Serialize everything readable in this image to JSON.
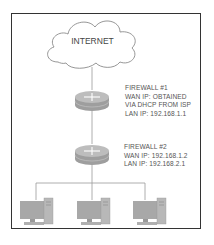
{
  "diagram": {
    "type": "network-topology",
    "cloud": {
      "label": "INTERNET"
    },
    "firewalls": [
      {
        "title": "FIREWALL #1",
        "lines": [
          "WAN IP: OBTAINED",
          "VIA DHCP FROM ISP",
          "LAN IP: 192.168.1.1"
        ]
      },
      {
        "title": "FIREWALL #2",
        "lines": [
          "WAN IP: 192.168.1.2",
          "LAN IP: 192.168.2.1"
        ]
      }
    ],
    "computers": [
      {
        "icon": "desktop-computer-icon"
      },
      {
        "icon": "desktop-computer-icon"
      },
      {
        "icon": "desktop-computer-icon"
      }
    ],
    "colors": {
      "frame": "#333333",
      "line": "#8a8a8a",
      "device": "#a8a8a8",
      "text": "#555555"
    }
  }
}
